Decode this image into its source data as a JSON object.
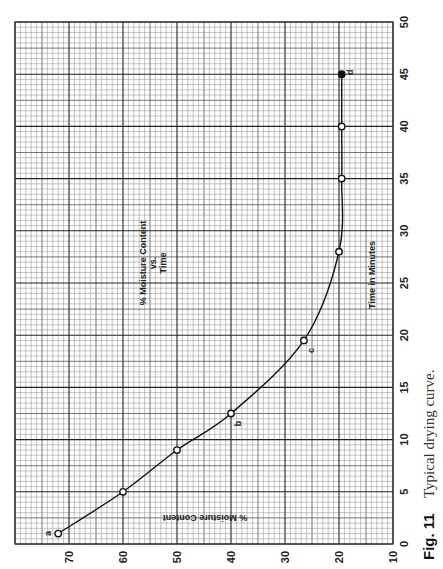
{
  "figure": {
    "number_label": "Fig. 11",
    "caption": "Typical drying curve."
  },
  "chart_data": {
    "type": "line",
    "orientation": "rotated-90-ccw",
    "title_lines": [
      "% Moisture Content",
      "vs.",
      "Time"
    ],
    "xlabel": "Time in Minutes",
    "ylabel": "% Moisture Content",
    "xlim": [
      0,
      50
    ],
    "ylim": [
      10,
      80
    ],
    "x_ticks": [
      0,
      5,
      10,
      15,
      20,
      25,
      30,
      35,
      40,
      45,
      50
    ],
    "y_ticks": [
      70,
      60,
      50,
      40,
      30,
      20,
      10
    ],
    "grid": true,
    "grid_minor_x": 0.5,
    "grid_minor_y": 1,
    "series": [
      {
        "name": "Moisture content",
        "x": [
          1,
          5,
          9,
          12.5,
          19.5,
          28,
          35,
          40,
          45
        ],
        "y": [
          72,
          60,
          50,
          40,
          26.5,
          20,
          19.5,
          19.5,
          19.5
        ],
        "point_labels": [
          "a",
          "",
          "",
          "b",
          "c",
          "",
          "",
          "",
          "d"
        ]
      }
    ],
    "line_color": "#111111",
    "grid_color": "#555555"
  }
}
